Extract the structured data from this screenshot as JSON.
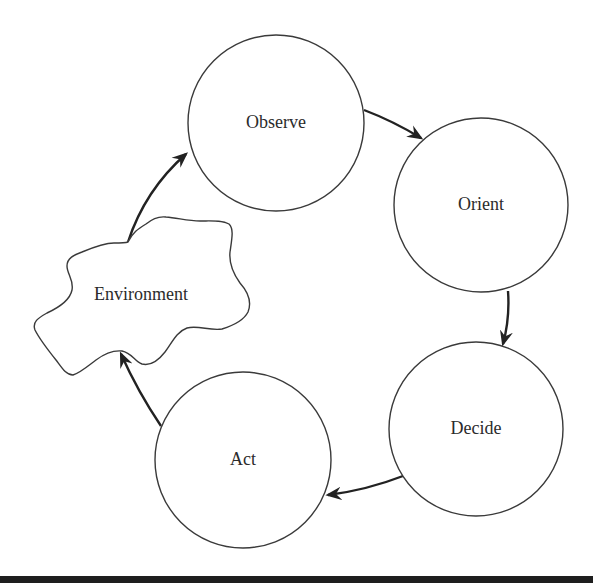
{
  "diagram": {
    "type": "cycle",
    "nodes": [
      {
        "id": "observe",
        "label": "Observe",
        "shape": "circle"
      },
      {
        "id": "orient",
        "label": "Orient",
        "shape": "circle"
      },
      {
        "id": "decide",
        "label": "Decide",
        "shape": "circle"
      },
      {
        "id": "act",
        "label": "Act",
        "shape": "circle"
      },
      {
        "id": "environment",
        "label": "Environment",
        "shape": "cloud"
      }
    ],
    "edges": [
      {
        "from": "observe",
        "to": "orient"
      },
      {
        "from": "orient",
        "to": "decide"
      },
      {
        "from": "decide",
        "to": "act"
      },
      {
        "from": "act",
        "to": "environment"
      },
      {
        "from": "environment",
        "to": "observe"
      }
    ]
  },
  "colors": {
    "stroke": "#3a3a3a",
    "arrow": "#222222",
    "text": "#2b2b2b",
    "bottom_rule": "#1e1e1e"
  }
}
